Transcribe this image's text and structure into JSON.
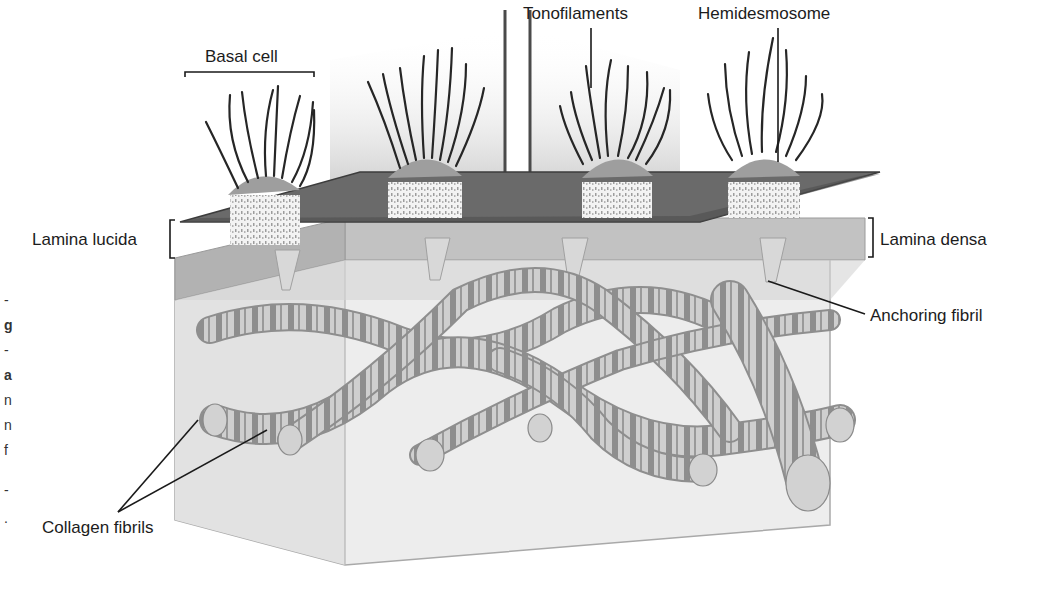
{
  "figure": {
    "labels": {
      "basal_cell": "Basal cell",
      "tonofilaments": "Tonofilaments",
      "hemidesmosome": "Hemidesmosome",
      "lamina_lucida": "Lamina lucida",
      "lamina_densa": "Lamina densa",
      "anchoring_fibril": "Anchoring fibril",
      "collagen_fibrils": "Collagen fibrils"
    },
    "left_margin_fragments": [
      "-",
      "g",
      "-",
      "a",
      "n",
      "n",
      "f",
      "-",
      "."
    ],
    "colors": {
      "background": "#ffffff",
      "membrane_dark": "#5a5a5a",
      "lamina_densa": "#b4b4b4",
      "connective_block": "#e9e9e9",
      "fibril_light": "#c8c8c8",
      "fibril_dark": "#8a8a8a",
      "line": "#1a1a1a"
    }
  }
}
